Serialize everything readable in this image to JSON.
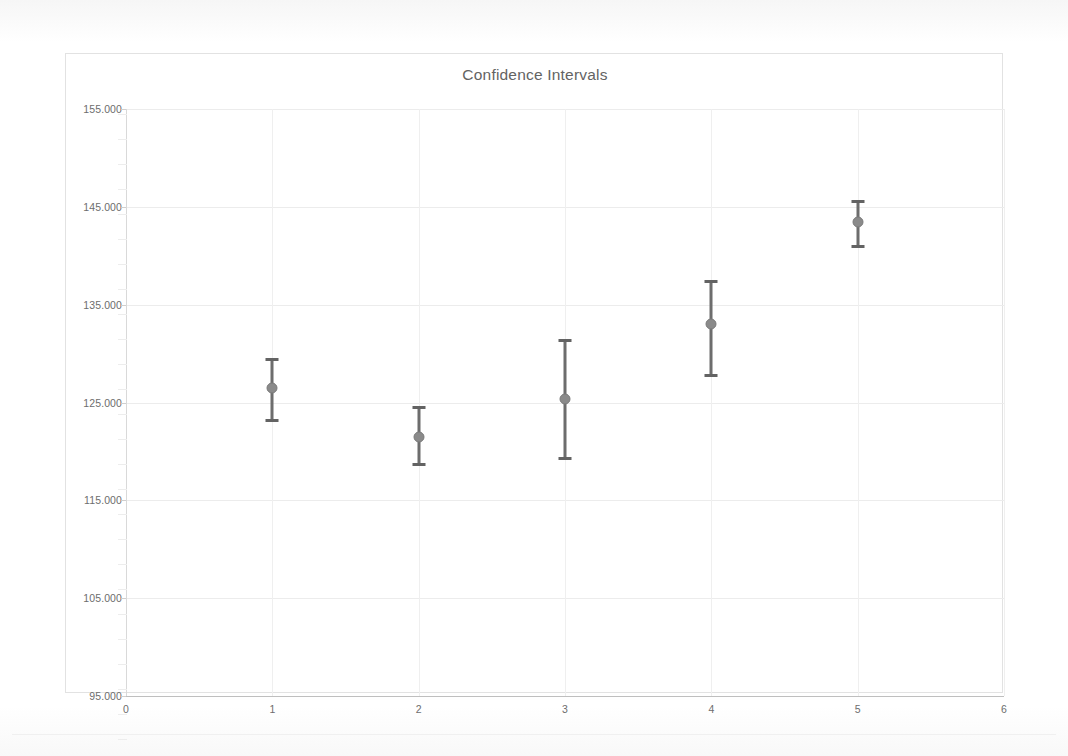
{
  "chart_data": {
    "type": "scatter",
    "title": "Confidence Intervals",
    "xlabel": "",
    "ylabel": "",
    "xlim": [
      0,
      6
    ],
    "ylim": [
      95,
      155
    ],
    "grid": true,
    "legend": "none",
    "x_ticks": [
      "0",
      "1",
      "2",
      "3",
      "4",
      "5",
      "6"
    ],
    "x_tick_values": [
      0,
      1,
      2,
      3,
      4,
      5,
      6
    ],
    "y_ticks": [
      "95.000",
      "105.000",
      "115.000",
      "125.000",
      "135.000",
      "145.000",
      "155.000"
    ],
    "y_tick_values": [
      95,
      105,
      115,
      125,
      135,
      145,
      155
    ],
    "x": [
      1,
      2,
      3,
      4,
      5
    ],
    "values": [
      126.5,
      121.5,
      125.4,
      133.0,
      143.5
    ],
    "error_low": [
      123.2,
      118.7,
      119.3,
      127.8,
      141.0
    ],
    "error_high": [
      129.4,
      124.5,
      131.4,
      137.4,
      145.6
    ],
    "series": [
      {
        "name": "Confidence Intervals",
        "marker_color": "#8a8a8a",
        "bar_color": "#6d6d6d",
        "points": [
          {
            "x": 1,
            "mean": 126.5,
            "low": 123.2,
            "high": 129.4
          },
          {
            "x": 2,
            "mean": 121.5,
            "low": 118.7,
            "high": 124.5
          },
          {
            "x": 3,
            "mean": 125.4,
            "low": 119.3,
            "high": 131.4
          },
          {
            "x": 4,
            "mean": 133.0,
            "low": 127.8,
            "high": 137.4
          },
          {
            "x": 5,
            "mean": 143.5,
            "low": 141.0,
            "high": 145.6
          }
        ]
      }
    ]
  },
  "colors": {
    "marker": "#8a8a8a",
    "errorbar": "#6d6d6d",
    "grid": "#ececec",
    "axis": "#bfbfbf",
    "text": "#6d6d6d",
    "title": "#636363",
    "background": "#ffffff"
  }
}
